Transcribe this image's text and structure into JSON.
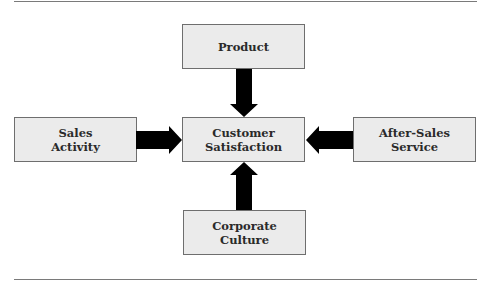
{
  "diagram": {
    "type": "flow",
    "center": {
      "id": "customer-satisfaction",
      "lines": [
        "Customer",
        "Satisfaction"
      ]
    },
    "nodes": [
      {
        "id": "product",
        "lines": [
          "Product",
          ""
        ],
        "position": "top"
      },
      {
        "id": "sales-activity",
        "lines": [
          "Sales",
          "Activity"
        ],
        "position": "left"
      },
      {
        "id": "after-sales-service",
        "lines": [
          "After-Sales",
          "Service"
        ],
        "position": "right"
      },
      {
        "id": "corporate-culture",
        "lines": [
          "Corporate",
          "Culture"
        ],
        "position": "bottom"
      }
    ],
    "edges": [
      {
        "from": "product",
        "to": "customer-satisfaction"
      },
      {
        "from": "sales-activity",
        "to": "customer-satisfaction"
      },
      {
        "from": "after-sales-service",
        "to": "customer-satisfaction"
      },
      {
        "from": "corporate-culture",
        "to": "customer-satisfaction"
      }
    ],
    "colors": {
      "box_fill": "#ebebeb",
      "box_border": "#6e6e6e",
      "arrow": "#000000",
      "rule": "#7a7a7a"
    }
  }
}
